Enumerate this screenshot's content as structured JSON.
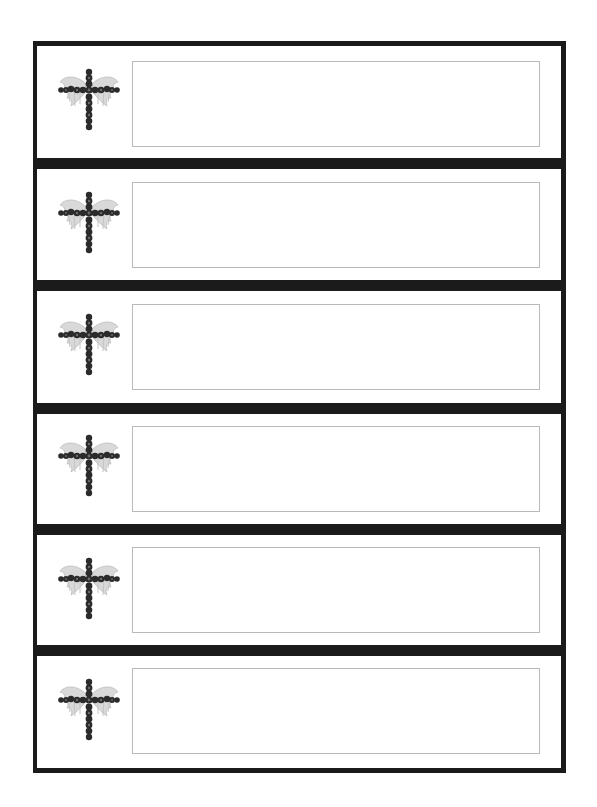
{
  "page": {
    "type": "printable label sheet",
    "row_count": 6,
    "colors": {
      "frame": "#1b1b1b",
      "separator": "#1b1b1b",
      "label_box_border": "#b9b9b9",
      "background": "#ffffff"
    }
  },
  "labels": [
    {
      "icon": "winged-jeweled-cross-icon",
      "text": ""
    },
    {
      "icon": "winged-jeweled-cross-icon",
      "text": ""
    },
    {
      "icon": "winged-jeweled-cross-icon",
      "text": ""
    },
    {
      "icon": "winged-jeweled-cross-icon",
      "text": ""
    },
    {
      "icon": "winged-jeweled-cross-icon",
      "text": ""
    },
    {
      "icon": "winged-jeweled-cross-icon",
      "text": ""
    }
  ]
}
